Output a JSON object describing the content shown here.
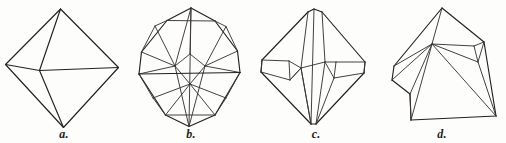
{
  "plate": {
    "title": "Crystal forms plate",
    "description": "Four line-drawn crystal habit figures: an octahedron and three modified octahedral forms.",
    "background_color": "#fdfdfc",
    "ink_color": "#23211f",
    "width": 506,
    "height": 143
  },
  "figures": [
    {
      "id": "a",
      "label": "a.",
      "name": "octahedron",
      "caption_label": "a.",
      "paths": [
        "M 60.5 9 L 5.5 64.5",
        "M 60.5 9 L 118.5 67.5",
        "M 5.5 64.5 L 63.5 127.5",
        "M 118.5 67.5 L 63.5 127.5",
        "M 60.5 9 L 39.5 70.5",
        "M 39.5 70.5 L 63.5 127.5",
        "M 5.5 64.5 L 39.5 70.5",
        "M 39.5 70.5 L 118.5 67.5"
      ]
    },
    {
      "id": "b",
      "label": "b.",
      "name": "octahedron-with-truncated-edges-and-corners",
      "caption_label": "b.",
      "paths": [
        "M 64 8 L 40 20.5",
        "M 64 8 L 88 21",
        "M 40 20.5 L 14.5 52",
        "M 88 21 L 110.5 51",
        "M 14.5 52 L 12 74",
        "M 110.5 51 L 113 72.5",
        "M 12 74 L 38.5 115",
        "M 113 72.5 L 88 115",
        "M 38.5 115 L 62 126.5",
        "M 88 115 L 62 126.5",
        "M 40 20.5 L 28 26",
        "M 88 21 L 99 26.5",
        "M 28 26 L 14.5 52",
        "M 99 26.5 L 110.5 51",
        "M 12 74 L 26 98",
        "M 113 72.5 L 99 98",
        "M 26 98 L 38.5 115",
        "M 99 98 L 88 115",
        "M 64 8 L 48 66",
        "M 64 8 L 62 126.5",
        "M 28 26 L 48 66",
        "M 99 26.5 L 78 66",
        "M 48 66 L 62 126.5",
        "M 78 66 L 62 126.5",
        "M 14.5 52 L 48 66",
        "M 110.5 51 L 78 66",
        "M 12 74 L 48 66",
        "M 113 72.5 L 78 66",
        "M 48 66 L 63 54",
        "M 63 54 L 78 66",
        "M 48 66 L 63 84",
        "M 63 84 L 78 66",
        "M 26 98 L 63 84",
        "M 99 98 L 63 84",
        "M 38.5 115 L 63 84",
        "M 88 115 L 63 84",
        "M 12 74 L 113 72.5",
        "M 40 20.5 L 88 21",
        "M 38.5 115 L 88 115",
        "M 63 54 L 64 8"
      ]
    },
    {
      "id": "c",
      "label": "c.",
      "name": "octahedron-with-bevelled-edges",
      "caption_label": "c.",
      "paths": [
        "M 62 9 L 56 12",
        "M 62 9 L 70 12",
        "M 56 12 L 10 60",
        "M 70 12 L 113 62",
        "M 10 60 L 9 72",
        "M 113 62 L 112 73",
        "M 9 72 L 59 124",
        "M 112 73 L 64 124",
        "M 59 124 L 64 124",
        "M 62 9 L 59 124",
        "M 56 12 L 49 68",
        "M 70 12 L 73 62",
        "M 49 68 L 59 124",
        "M 73 62 L 64 124",
        "M 10 60 L 37 61",
        "M 113 62 L 84 62",
        "M 9 72 L 38 80",
        "M 112 73 L 82 78",
        "M 37 61 L 49 68",
        "M 84 62 L 73 62",
        "M 38 80 L 49 68",
        "M 82 78 L 73 62",
        "M 37 61 L 38 80",
        "M 84 62 L 82 78",
        "M 49 68 L 73 62",
        "M 49 68 L 38 80",
        "M 10 60 L 9 72",
        "M 113 62 L 112 73",
        "M 59 124 L 49 68",
        "M 64 124 L 82 78"
      ]
    },
    {
      "id": "d",
      "label": "d.",
      "name": "distorted-octahedron-block",
      "caption_label": "d.",
      "paths": [
        "M 64 8 L 16 66",
        "M 64 8 L 106 42",
        "M 16 66 L 14 80",
        "M 106 42 L 118 116",
        "M 14 80 L 32 94",
        "M 32 94 L 33 120",
        "M 33 120 L 118 116",
        "M 64 8 L 54 44",
        "M 54 44 L 16 66",
        "M 54 44 L 96 46",
        "M 96 46 L 106 42",
        "M 54 44 L 32 94",
        "M 54 44 L 118 116",
        "M 96 46 L 100 62",
        "M 100 62 L 54 44",
        "M 100 62 L 118 116",
        "M 14 80 L 54 44",
        "M 32 94 L 33 120",
        "M 106 42 L 100 62",
        "M 33 120 L 54 44"
      ]
    }
  ]
}
